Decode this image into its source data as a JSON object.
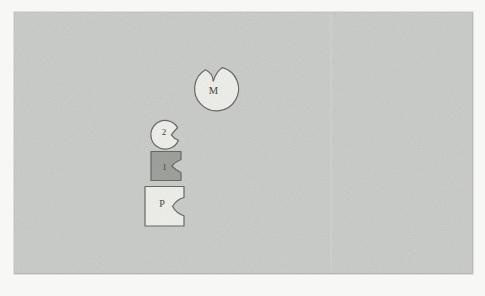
{
  "figure": {
    "page_background": "#f7f7f5",
    "panel": {
      "fill": "#d3d5d2",
      "edge": "#c7c9c6",
      "bottom_shadow": "#bcbebb",
      "seam": "#e2e4e1"
    },
    "outline_color": "#6e6f68",
    "label_color": "#4a4b47",
    "shapes": [
      {
        "name": "large-notched-circle",
        "label": "M",
        "fill": "#f8f8f5"
      },
      {
        "name": "small-notched-circle",
        "label": "2",
        "fill": "#f8f8f5"
      },
      {
        "name": "notched-square",
        "label": "1",
        "fill": "#a6a8a3"
      },
      {
        "name": "notched-rectangle",
        "label": "P",
        "fill": "#f8f8f5"
      }
    ]
  }
}
